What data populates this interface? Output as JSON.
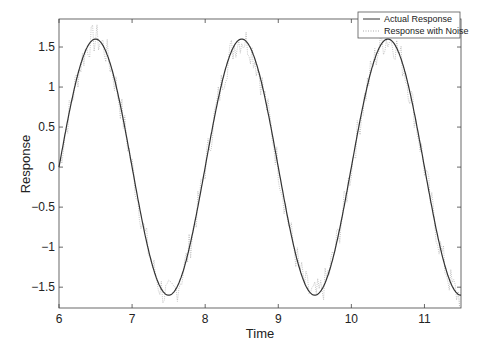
{
  "chart_data": {
    "type": "line",
    "title": "",
    "xlabel": "Time",
    "ylabel": "Response",
    "xlim": [
      6,
      11.5
    ],
    "ylim": [
      -1.76,
      1.85
    ],
    "xticks": [
      6,
      7,
      8,
      9,
      10,
      11
    ],
    "yticks": [
      -1.5,
      -1,
      -0.5,
      0,
      0.5,
      1,
      1.5
    ],
    "xtick_labels": [
      "6",
      "7",
      "8",
      "9",
      "10",
      "11"
    ],
    "ytick_labels": [
      "−1.5",
      "−1",
      "−0.5",
      "0",
      "0.5",
      "1",
      "1.5"
    ],
    "grid": false,
    "legend_position": "upper right",
    "series": [
      {
        "name": "Actual Response",
        "style": "solid",
        "color": "#333333",
        "function": "1.6*sin(pi*(t-6))",
        "x": [
          6,
          6.5,
          7,
          7.5,
          8,
          8.5,
          9,
          9.5,
          10,
          10.5,
          11,
          11.5
        ],
        "values": [
          0,
          1.6,
          0,
          -1.6,
          0,
          1.6,
          0,
          -1.6,
          0,
          1.6,
          0,
          -1.6
        ]
      },
      {
        "name": "Response with Noise",
        "style": "dotted",
        "color": "#aaaaaa",
        "noise_amplitude": 0.2,
        "x": [
          6,
          6.5,
          7,
          7.5,
          8,
          8.5,
          9,
          9.5,
          10,
          10.5,
          11,
          11.5
        ],
        "values": [
          0,
          1.6,
          0,
          -1.6,
          0,
          1.6,
          0,
          -1.6,
          0,
          1.6,
          0,
          -1.6
        ]
      }
    ]
  }
}
